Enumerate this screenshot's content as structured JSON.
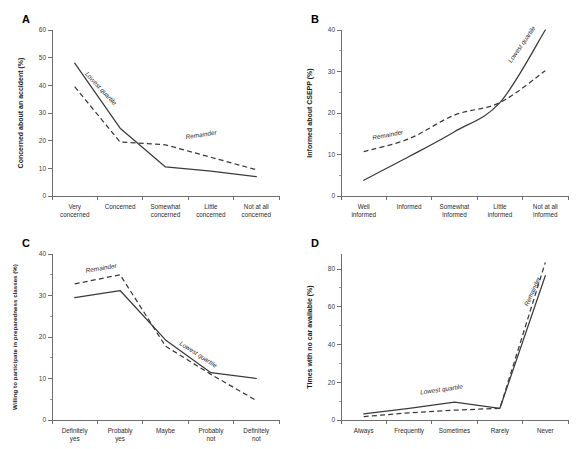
{
  "figure": {
    "title": "",
    "panel_letters": [
      "A",
      "B",
      "C",
      "D"
    ],
    "series_names": [
      "Lowest quartile",
      "Remainder"
    ]
  },
  "chart_data": [
    {
      "type": "line",
      "panel": "A",
      "title": "",
      "xlabel": "",
      "ylabel": "Concerned about an accident (%)",
      "categories": [
        "Very concerned",
        "Concerned",
        "Somewhat concerned",
        "Little concerned",
        "Not at all concerned"
      ],
      "category_lines": [
        [
          "Very",
          "concerned"
        ],
        [
          "Concerned"
        ],
        [
          "Somewhat",
          "concerned"
        ],
        [
          "Little",
          "concerned"
        ],
        [
          "Not at all",
          "concerned"
        ]
      ],
      "ylim": [
        0,
        60
      ],
      "yticks": [
        0,
        10,
        20,
        30,
        40,
        50,
        60
      ],
      "ytick_labels": [
        "0",
        "10",
        "20",
        "30",
        "40",
        "50",
        "60"
      ],
      "grid": false,
      "legend": "inline-annotation",
      "series": [
        {
          "name": "Lowest quartile",
          "style": "solid",
          "values": [
            48,
            24.5,
            10.5,
            9,
            7
          ]
        },
        {
          "name": "Remainder",
          "style": "dashed",
          "values": [
            39.5,
            19.5,
            18.5,
            14,
            9.5
          ]
        }
      ],
      "annotations": [
        {
          "text": "Lowest quartile",
          "x": 0.22,
          "y": 44,
          "rotation": 47
        },
        {
          "text": "Remainder",
          "x": 2.45,
          "y": 20.5,
          "rotation": -9
        }
      ]
    },
    {
      "type": "line",
      "panel": "B",
      "title": "",
      "xlabel": "",
      "ylabel": "Informed about CSEPP (%)",
      "categories": [
        "Well informed",
        "Informed",
        "Somewhat informed",
        "Little informed",
        "Not at all informed"
      ],
      "category_lines": [
        [
          "Well",
          "informed"
        ],
        [
          "Informed"
        ],
        [
          "Somewhat",
          "informed"
        ],
        [
          "Little",
          "informed"
        ],
        [
          "Not at all",
          "informed"
        ]
      ],
      "ylim": [
        0,
        40
      ],
      "yticks": [
        0,
        10,
        20,
        30,
        40
      ],
      "ytick_labels": [
        "0",
        "10",
        "20",
        "30",
        "40"
      ],
      "yticks_minor": [
        5,
        15,
        25,
        35
      ],
      "grid": false,
      "legend": "inline-annotation",
      "series": [
        {
          "name": "Lowest quartile",
          "style": "solid",
          "values": [
            3.8,
            9.5,
            15.5,
            22.5,
            40
          ]
        },
        {
          "name": "Remainder",
          "style": "dashed",
          "values": [
            10.7,
            13.8,
            19.5,
            22.5,
            30.2
          ]
        }
      ],
      "annotations": [
        {
          "text": "Remainder",
          "x": 0.2,
          "y": 13.5,
          "rotation": -11
        },
        {
          "text": "Lowest quartile",
          "x": 3.25,
          "y": 32,
          "rotation": -55
        }
      ]
    },
    {
      "type": "line",
      "panel": "C",
      "title": "",
      "xlabel": "",
      "ylabel": "Willing to participate in preparedness classes (%)",
      "categories": [
        "Definitely yes",
        "Probably yes",
        "Maybe",
        "Probably not",
        "Definitely not"
      ],
      "category_lines": [
        [
          "Definitely",
          "yes"
        ],
        [
          "Probably",
          "yes"
        ],
        [
          "Maybe"
        ],
        [
          "Probably",
          "not"
        ],
        [
          "Definitely",
          "not"
        ]
      ],
      "ylim": [
        0,
        40
      ],
      "yticks": [
        0,
        10,
        20,
        30,
        40
      ],
      "ytick_labels": [
        "0",
        "10",
        "20",
        "30",
        "40"
      ],
      "yticks_minor": [
        5,
        15,
        25,
        35
      ],
      "grid": false,
      "legend": "inline-annotation",
      "series": [
        {
          "name": "Lowest quartile",
          "style": "solid",
          "values": [
            29.5,
            31.2,
            19.3,
            11.4,
            10.0
          ]
        },
        {
          "name": "Remainder",
          "style": "dashed",
          "values": [
            32.8,
            35.0,
            17.8,
            11.0,
            4.7
          ]
        }
      ],
      "annotations": [
        {
          "text": "Remainder",
          "x": 0.25,
          "y": 35.5,
          "rotation": -9
        },
        {
          "text": "Lowest quartile",
          "x": 2.3,
          "y": 18.2,
          "rotation": 33
        }
      ]
    },
    {
      "type": "line",
      "panel": "D",
      "title": "",
      "xlabel": "",
      "ylabel": "Times with no car available (%)",
      "categories": [
        "Always",
        "Frequently",
        "Sometimes",
        "Rarely",
        "Never"
      ],
      "category_lines": [
        [
          "Always"
        ],
        [
          "Frequently"
        ],
        [
          "Sometimes"
        ],
        [
          "Rarely"
        ],
        [
          "Never"
        ]
      ],
      "ylim": [
        0,
        88
      ],
      "yticks": [
        0,
        20,
        40,
        60,
        80
      ],
      "ytick_labels": [
        "0",
        "20",
        "40",
        "60",
        "80"
      ],
      "yticks_minor": [
        10,
        30,
        50,
        70
      ],
      "grid": false,
      "legend": "inline-annotation",
      "series": [
        {
          "name": "Lowest quartile",
          "style": "solid",
          "values": [
            3.2,
            6.2,
            9.5,
            6.2,
            76.5
          ]
        },
        {
          "name": "Remainder",
          "style": "dashed",
          "values": [
            1.8,
            3.8,
            5.2,
            6.2,
            83.5
          ]
        }
      ],
      "annotations": [
        {
          "text": "Lowest quartile",
          "x": 1.25,
          "y": 13.5,
          "rotation": -8
        },
        {
          "text": "Remainder",
          "x": 3.62,
          "y": 60,
          "rotation": -66
        }
      ]
    }
  ]
}
